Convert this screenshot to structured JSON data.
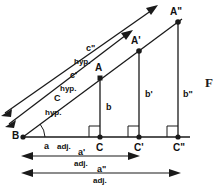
{
  "figure": {
    "type": "geometry-diagram",
    "background_color": "#ffffff",
    "line_color": "#1a1a1a",
    "caption_fragment": "F"
  },
  "points": [
    {
      "id": "B",
      "label": "B",
      "x": 23,
      "y": 137
    },
    {
      "id": "A",
      "label": "A",
      "x": 100,
      "y": 78
    },
    {
      "id": "Aprime",
      "label": "A'",
      "x": 139,
      "y": 51
    },
    {
      "id": "A2",
      "label": "A\"",
      "x": 178,
      "y": 22
    },
    {
      "id": "C",
      "label": "C",
      "x": 100,
      "y": 137
    },
    {
      "id": "Cprime",
      "label": "C'",
      "x": 139,
      "y": 137
    },
    {
      "id": "C2",
      "label": "C\"",
      "x": 178,
      "y": 137
    }
  ],
  "hypotenuse_arrows": [
    {
      "id": "c",
      "name_label": "C",
      "unit_label": "hyp.",
      "name_x": 54,
      "name_y": 99,
      "unit_x": 49,
      "unit_y": 112
    },
    {
      "id": "cp",
      "name_label": "c'",
      "unit_label": "hyp.",
      "name_x": 70,
      "name_y": 77,
      "unit_x": 64,
      "unit_y": 89
    },
    {
      "id": "c2",
      "name_label": "c\"",
      "unit_label": "hyp.",
      "name_x": 86,
      "name_y": 50,
      "unit_x": 79,
      "unit_y": 62
    }
  ],
  "opposite_sides": [
    {
      "id": "b",
      "label": "b",
      "x": 108,
      "y": 108
    },
    {
      "id": "bp",
      "label": "b'",
      "x": 147,
      "y": 95
    },
    {
      "id": "b2",
      "label": "b\"",
      "x": 186,
      "y": 95
    }
  ],
  "adjacent_sides": [
    {
      "id": "a",
      "name_label": "a",
      "unit_label": "adj.",
      "name_x": 47,
      "name_y": 146,
      "unit_x": 66,
      "unit_y": 146
    },
    {
      "id": "ap",
      "name_label": "a'",
      "unit_label": "adj.",
      "name_x": 82,
      "name_y": 152,
      "unit_x": 82,
      "unit_y": 163
    },
    {
      "id": "a2",
      "name_label": "a\"",
      "unit_label": "adj.",
      "name_x": 101,
      "name_y": 169,
      "unit_x": 101,
      "unit_y": 180
    }
  ],
  "dimension_lines": [
    {
      "id": "a-prime-dim",
      "x1": 22,
      "x2": 139,
      "y": 156
    },
    {
      "id": "a-double-dim",
      "x1": 22,
      "x2": 180,
      "y": 173
    }
  ],
  "angle_mark": {
    "id": "theta-at-B",
    "cx": 23,
    "cy": 137,
    "radius": 22
  },
  "right_angle_marks": [
    {
      "id": "right-angle-C",
      "x": 100,
      "y": 137
    },
    {
      "id": "right-angle-Cp",
      "x": 139,
      "y": 137
    },
    {
      "id": "right-angle-C2",
      "x": 178,
      "y": 137
    }
  ]
}
